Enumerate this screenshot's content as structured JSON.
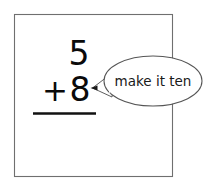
{
  "canvas": {
    "width": 215,
    "height": 187,
    "background": "#ffffff"
  },
  "worksheet_box": {
    "name": "problem-frame",
    "stroke": "#6f6f6f",
    "fill": "#ffffff",
    "x": 14,
    "y": 14,
    "width": 158,
    "height": 163
  },
  "problem": {
    "type": "vertical-addition",
    "addend_top": "5",
    "operator": "+",
    "addend_bottom": "8",
    "sum": "",
    "rule_color": "#111111",
    "digit_color": "#0a0a0a"
  },
  "callout": {
    "name": "make-it-ten-callout",
    "text": "make it ten",
    "shape": "ellipse",
    "stroke": "#555555",
    "fill": "#ffffff",
    "text_color": "#1a1a1a",
    "center_x": 153,
    "center_y": 81,
    "radius_x": 49,
    "radius_y": 25,
    "pointer_target_x": 91,
    "pointer_target_y": 88
  }
}
